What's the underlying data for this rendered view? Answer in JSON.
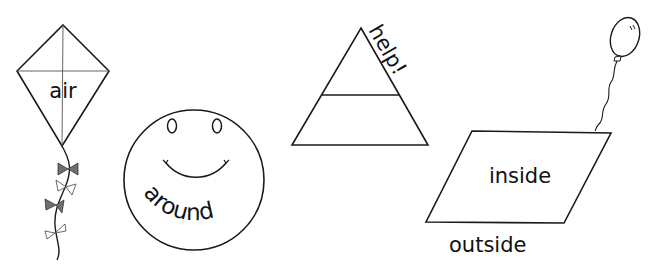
{
  "figure": {
    "background": "#ffffff",
    "stroke_color": "#1a1a1a",
    "bow_fill": "#6f6f6f",
    "shapes": [
      {
        "name": "kite",
        "word": "air"
      },
      {
        "name": "smiley-face",
        "word": "around"
      },
      {
        "name": "triangle",
        "word": "help!"
      },
      {
        "name": "parallelogram",
        "word_inside": "inside",
        "word_outside": "outside"
      }
    ]
  }
}
